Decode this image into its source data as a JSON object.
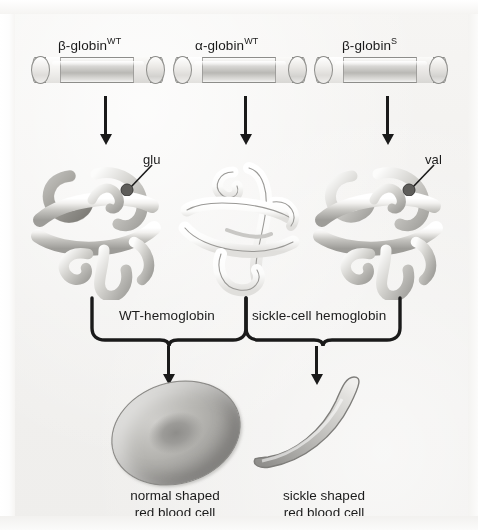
{
  "figure": {
    "background_color": "#f4f3f1",
    "ink_color": "#1a1a1a"
  },
  "protein_labels": [
    {
      "id": "beta-globin-wt",
      "base": "β-globin",
      "sup": "WT"
    },
    {
      "id": "alpha-globin-wt",
      "base": "α-globin",
      "sup": "WT"
    },
    {
      "id": "beta-globin-s",
      "base": "β-globin",
      "sup": "S"
    }
  ],
  "residue_callouts": [
    {
      "id": "glu",
      "label": "glu",
      "on": "beta-globin-wt"
    },
    {
      "id": "val",
      "label": "val",
      "on": "beta-globin-s"
    }
  ],
  "hemoglobin_brackets": [
    {
      "id": "wt-hemoglobin",
      "label": "WT-hemoglobin"
    },
    {
      "id": "sickle-cell-hemoglobin",
      "label": "sickle-cell hemoglobin"
    }
  ],
  "cells": [
    {
      "id": "normal-rbc",
      "line1": "normal shaped",
      "line2": "red blood cell"
    },
    {
      "id": "sickle-rbc",
      "line1": "sickle shaped",
      "line2": "red blood cell"
    }
  ],
  "icons": {
    "down_arrow": "down-arrow-icon",
    "curly_bracket": "curly-bracket-icon"
  }
}
